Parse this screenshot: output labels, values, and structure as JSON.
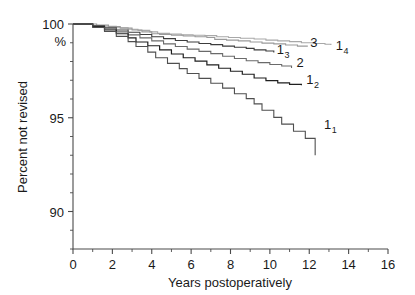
{
  "chart_data": {
    "type": "line",
    "title": "",
    "subtitle": "",
    "xlabel": "Years postoperatively",
    "ylabel": "Percent not revised",
    "y_unit_label": "%",
    "xlim": [
      0,
      16
    ],
    "ylim": [
      88,
      100
    ],
    "x_ticks": [
      0,
      2,
      4,
      6,
      8,
      10,
      12,
      14,
      16
    ],
    "x_tick_labels": [
      "0",
      "2",
      "4",
      "6",
      "8",
      "10",
      "12",
      "14",
      "16"
    ],
    "x_minor_step": 1,
    "y_ticks": [
      90,
      95,
      100
    ],
    "y_tick_labels": [
      "90",
      "95",
      "100"
    ],
    "y_minor_step": 1,
    "grid": false,
    "legend_position": "inline-right-of-curve-ends",
    "series": [
      {
        "name": "1_4",
        "label": "1",
        "label_sub": "4",
        "color": "#a8a8a8",
        "label_color": "#6e6e6e",
        "width": 1.1,
        "label_x": 13.35,
        "label_y": 98.62,
        "points": [
          [
            0,
            100
          ],
          [
            0.6,
            100
          ],
          [
            1.0,
            99.92
          ],
          [
            1.6,
            99.88
          ],
          [
            2.2,
            99.8
          ],
          [
            2.8,
            99.72
          ],
          [
            3.3,
            99.66
          ],
          [
            3.9,
            99.58
          ],
          [
            4.3,
            99.5
          ],
          [
            4.9,
            99.46
          ],
          [
            5.5,
            99.42
          ],
          [
            6.1,
            99.4
          ],
          [
            6.7,
            99.38
          ],
          [
            7.3,
            99.32
          ],
          [
            7.9,
            99.28
          ],
          [
            8.5,
            99.24
          ],
          [
            9.2,
            99.2
          ],
          [
            9.8,
            99.14
          ],
          [
            10.4,
            99.1
          ],
          [
            11.0,
            99.06
          ],
          [
            11.6,
            99.0
          ],
          [
            12.2,
            98.96
          ],
          [
            12.8,
            98.92
          ],
          [
            13.1,
            98.88
          ]
        ]
      },
      {
        "name": "3",
        "label": "3",
        "label_sub": "",
        "color": "#9a9a9a",
        "label_color": "#8a8a8a",
        "width": 1.1,
        "label_x": 12.05,
        "label_y": 98.8,
        "points": [
          [
            0,
            100
          ],
          [
            0.7,
            100
          ],
          [
            1.2,
            99.94
          ],
          [
            1.8,
            99.86
          ],
          [
            2.4,
            99.78
          ],
          [
            3.0,
            99.68
          ],
          [
            3.5,
            99.58
          ],
          [
            4.0,
            99.48
          ],
          [
            4.4,
            99.44
          ],
          [
            5.0,
            99.4
          ],
          [
            5.6,
            99.36
          ],
          [
            6.2,
            99.32
          ],
          [
            6.8,
            99.28
          ],
          [
            7.2,
            99.18
          ],
          [
            7.8,
            99.14
          ],
          [
            8.4,
            99.1
          ],
          [
            9.0,
            99.04
          ],
          [
            9.6,
            98.98
          ],
          [
            10.2,
            98.94
          ],
          [
            10.8,
            98.88
          ],
          [
            11.4,
            98.82
          ],
          [
            11.9,
            98.78
          ]
        ]
      },
      {
        "name": "1_3",
        "label": "1",
        "label_sub": "3",
        "color": "#3c3c3c",
        "label_color": "#262626",
        "width": 1.1,
        "label_x": 10.35,
        "label_y": 98.38,
        "points": [
          [
            0,
            100
          ],
          [
            0.5,
            100
          ],
          [
            1.0,
            99.9
          ],
          [
            1.6,
            99.8
          ],
          [
            2.2,
            99.68
          ],
          [
            2.8,
            99.56
          ],
          [
            3.4,
            99.44
          ],
          [
            4.0,
            99.32
          ],
          [
            4.6,
            99.22
          ],
          [
            5.2,
            99.12
          ],
          [
            5.8,
            99.04
          ],
          [
            6.4,
            98.96
          ],
          [
            7.0,
            98.9
          ],
          [
            7.6,
            98.82
          ],
          [
            8.2,
            98.76
          ],
          [
            8.8,
            98.7
          ],
          [
            9.2,
            98.62
          ],
          [
            9.8,
            98.56
          ],
          [
            10.2,
            98.48
          ]
        ]
      },
      {
        "name": "2",
        "label": "2",
        "label_sub": "",
        "color": "#6a6a6a",
        "label_color": "#303030",
        "width": 1.1,
        "label_x": 11.35,
        "label_y": 97.72,
        "points": [
          [
            0,
            100
          ],
          [
            0.5,
            100
          ],
          [
            1.0,
            99.88
          ],
          [
            1.6,
            99.74
          ],
          [
            2.2,
            99.58
          ],
          [
            2.8,
            99.42
          ],
          [
            3.4,
            99.26
          ],
          [
            4.0,
            99.1
          ],
          [
            4.6,
            98.94
          ],
          [
            5.2,
            98.8
          ],
          [
            5.8,
            98.66
          ],
          [
            6.4,
            98.54
          ],
          [
            7.0,
            98.42
          ],
          [
            7.6,
            98.28
          ],
          [
            8.2,
            98.16
          ],
          [
            8.8,
            98.04
          ],
          [
            9.4,
            97.94
          ],
          [
            10.0,
            97.84
          ],
          [
            10.6,
            97.76
          ],
          [
            11.1,
            97.66
          ]
        ]
      },
      {
        "name": "1_2",
        "label": "1",
        "label_sub": "2",
        "color": "#1f1f1f",
        "label_color": "#1a1a1a",
        "width": 1.2,
        "label_x": 11.85,
        "label_y": 96.78,
        "points": [
          [
            0,
            100
          ],
          [
            0.5,
            100
          ],
          [
            1.0,
            99.86
          ],
          [
            1.6,
            99.68
          ],
          [
            2.2,
            99.48
          ],
          [
            2.8,
            99.26
          ],
          [
            3.2,
            99.04
          ],
          [
            3.8,
            98.84
          ],
          [
            4.4,
            98.62
          ],
          [
            5.0,
            98.4
          ],
          [
            5.6,
            98.2
          ],
          [
            6.2,
            98.02
          ],
          [
            6.8,
            97.82
          ],
          [
            7.4,
            97.64
          ],
          [
            8.0,
            97.48
          ],
          [
            8.6,
            97.32
          ],
          [
            9.2,
            97.12
          ],
          [
            9.8,
            96.98
          ],
          [
            10.4,
            96.86
          ],
          [
            11.0,
            96.78
          ],
          [
            11.6,
            96.74
          ]
        ]
      },
      {
        "name": "1_1",
        "label": "1",
        "label_sub": "1",
        "color": "#4f4f4f",
        "label_color": "#262626",
        "width": 1.1,
        "label_x": 12.75,
        "label_y": 94.4,
        "points": [
          [
            0,
            100
          ],
          [
            0.5,
            100
          ],
          [
            1.0,
            99.82
          ],
          [
            1.6,
            99.6
          ],
          [
            2.2,
            99.34
          ],
          [
            2.8,
            99.06
          ],
          [
            3.2,
            98.8
          ],
          [
            3.8,
            98.5
          ],
          [
            4.2,
            98.2
          ],
          [
            4.8,
            97.9
          ],
          [
            5.4,
            97.62
          ],
          [
            5.8,
            97.36
          ],
          [
            6.4,
            97.1
          ],
          [
            7.0,
            96.84
          ],
          [
            7.6,
            96.58
          ],
          [
            8.2,
            96.28
          ],
          [
            8.8,
            96.02
          ],
          [
            9.2,
            95.74
          ],
          [
            9.6,
            95.4
          ],
          [
            10.2,
            95.02
          ],
          [
            10.6,
            94.66
          ],
          [
            11.2,
            94.28
          ],
          [
            11.8,
            93.9
          ],
          [
            12.3,
            93.0
          ]
        ]
      }
    ]
  }
}
